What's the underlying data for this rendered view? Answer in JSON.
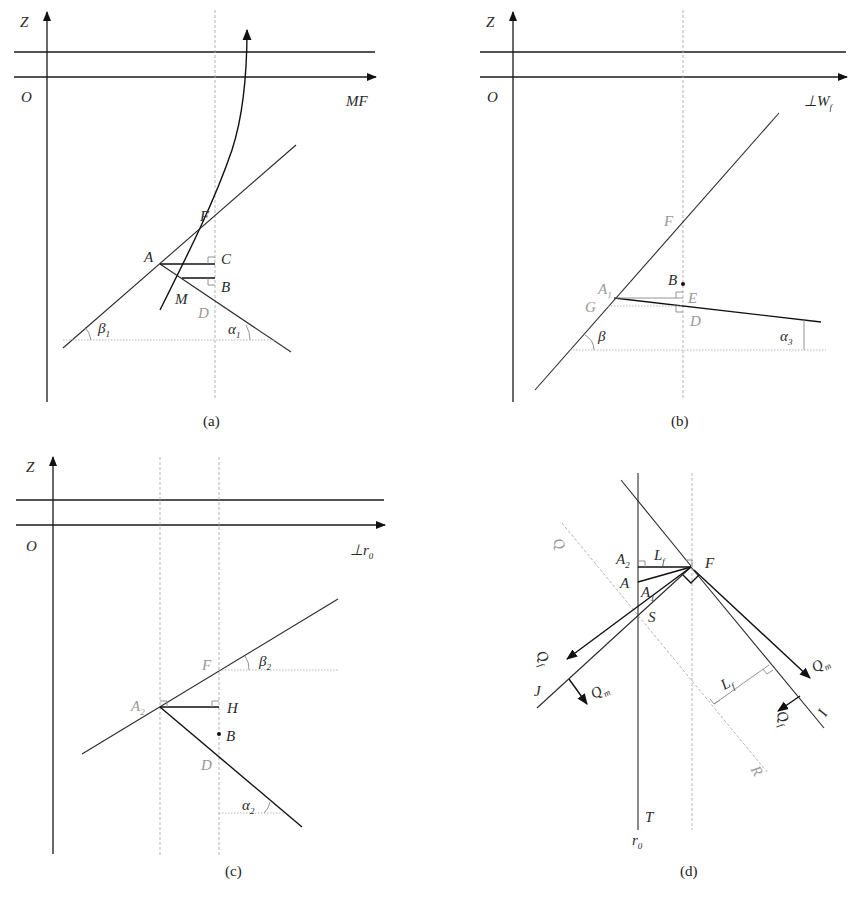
{
  "panels": {
    "a": {
      "caption": "(a)",
      "axis_y": "Z",
      "origin": "O",
      "axis_x": "MF",
      "points": {
        "F": "F",
        "A": "A",
        "C": "C",
        "B": "B",
        "M": "M",
        "D": "D"
      },
      "angles": {
        "beta": "β",
        "beta_sub": "1",
        "alpha": "α",
        "alpha_sub": "1"
      }
    },
    "b": {
      "caption": "(b)",
      "axis_y": "Z",
      "origin": "O",
      "axis_x": "⊥W",
      "axis_x_sub": "f",
      "points": {
        "F": "F",
        "A": "A",
        "A_sub": "1",
        "G": "G",
        "B": "B",
        "E": "E",
        "D": "D"
      },
      "angles": {
        "beta": "β",
        "alpha": "α",
        "alpha_sub": "3"
      }
    },
    "c": {
      "caption": "(c)",
      "axis_y": "Z",
      "origin": "O",
      "axis_x": "⊥r",
      "axis_x_sub": "0",
      "points": {
        "F": "F",
        "A": "A",
        "A_sub": "2",
        "H": "H",
        "B": "B",
        "D": "D"
      },
      "angles": {
        "beta": "β",
        "beta_sub": "2",
        "alpha": "α",
        "alpha_sub": "2"
      }
    },
    "d": {
      "caption": "(d)",
      "points": {
        "A2": "A",
        "A2_sub": "2",
        "L": "L",
        "L_sub": "f",
        "F": "F",
        "A": "A",
        "A1": "A",
        "A1_sub": "1",
        "S": "S",
        "Q": "Q",
        "J": "J",
        "I": "I",
        "R": "R",
        "T": "T",
        "r0": "r",
        "r0_sub": "0",
        "Lf2": "L",
        "Lf2_sub": "f"
      },
      "forces": {
        "Qf": "Q",
        "Qf_sub": "f",
        "Qm": "Q",
        "Qm_sub": "m"
      }
    }
  }
}
